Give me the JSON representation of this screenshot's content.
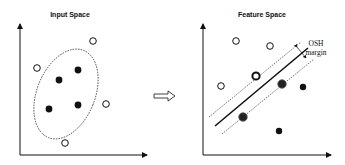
{
  "left_panel": {
    "title": "Input Space",
    "open_points": [
      [
        93,
        41
      ],
      [
        37,
        68
      ],
      [
        106,
        104
      ],
      [
        65,
        143
      ]
    ],
    "filled_points": [
      [
        78,
        70
      ],
      [
        59,
        80
      ],
      [
        49,
        109
      ],
      [
        78,
        105
      ]
    ]
  },
  "arrow": {
    "label": "transform-arrow"
  },
  "right_panel": {
    "title": "Feature Space",
    "annotation_line1": "OSH",
    "annotation_line2": "margin",
    "open_points": [
      [
        236,
        41
      ],
      [
        270,
        46
      ],
      [
        221,
        86
      ]
    ],
    "support_open_points": [
      [
        256,
        76
      ]
    ],
    "filled_points": [
      [
        303,
        87
      ],
      [
        279,
        131
      ]
    ],
    "support_filled_points": [
      [
        282,
        84
      ],
      [
        243,
        117
      ]
    ]
  },
  "colors": {
    "ink": "#111111",
    "background": "#ffffff"
  }
}
